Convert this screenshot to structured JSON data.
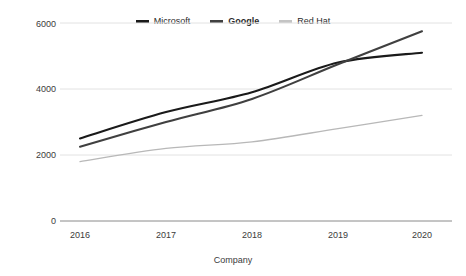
{
  "chart_data": {
    "type": "line",
    "title": "",
    "xlabel": "Company",
    "ylabel": "",
    "categories": [
      "2016",
      "2017",
      "2018",
      "2019",
      "2020"
    ],
    "yticks": [
      "0",
      "2000",
      "4000",
      "6000"
    ],
    "ylim": [
      0,
      6000
    ],
    "grid": true,
    "legend_position": "top-center",
    "series": [
      {
        "name": "Microsoft",
        "color": "#1a1a1a",
        "emphasis": "normal",
        "values": [
          2500,
          3300,
          3900,
          4800,
          5100
        ]
      },
      {
        "name": "Google",
        "color": "#404040",
        "emphasis": "bold",
        "values": [
          2250,
          3000,
          3700,
          4750,
          5750
        ]
      },
      {
        "name": "Red Hat",
        "color": "#b8b8b8",
        "emphasis": "normal",
        "values": [
          1800,
          2200,
          2400,
          2800,
          3200
        ]
      }
    ]
  },
  "axis": {
    "y_labels": [
      "6000",
      "4000",
      "2000",
      "0"
    ],
    "x_labels": [
      "2016",
      "2017",
      "2018",
      "2019",
      "2020"
    ],
    "x_title": "Company"
  },
  "legend": {
    "items": [
      {
        "label": "Microsoft",
        "color": "#1a1a1a"
      },
      {
        "label": "Google",
        "color": "#404040"
      },
      {
        "label": "Red Hat",
        "color": "#c4c4c4"
      }
    ]
  },
  "colors": {
    "gridline": "#e2e2e2",
    "axis": "#8a8a8a",
    "text": "#3b3b3b",
    "background": "#ffffff"
  }
}
